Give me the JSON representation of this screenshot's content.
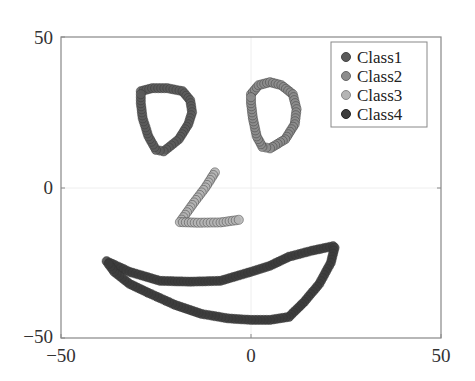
{
  "chart_data": {
    "type": "scatter",
    "title": "",
    "xlabel": "",
    "ylabel": "",
    "xlim": [
      -50,
      50
    ],
    "ylim": [
      -50,
      50
    ],
    "xticks": [
      -50,
      0,
      50
    ],
    "yticks": [
      -50,
      0,
      50
    ],
    "x_tick_labels": [
      "−50",
      "0",
      "50"
    ],
    "y_tick_labels": [
      "−50",
      "0",
      "50"
    ],
    "grid": true,
    "legend_position": "upper right",
    "series": [
      {
        "name": "Class1",
        "color": "#5a5a5a",
        "description": "left eye (closed loop)",
        "path": [
          [
            -29,
            32
          ],
          [
            -26,
            33
          ],
          [
            -22,
            33
          ],
          [
            -18,
            32
          ],
          [
            -16,
            29
          ],
          [
            -15.5,
            25
          ],
          [
            -16.5,
            21
          ],
          [
            -19,
            16
          ],
          [
            -23,
            12
          ],
          [
            -25,
            12.5
          ],
          [
            -27,
            17
          ],
          [
            -28.5,
            23
          ],
          [
            -29,
            28
          ],
          [
            -29,
            32
          ]
        ]
      },
      {
        "name": "Class2",
        "color": "#8c8c8c",
        "description": "right eye (closed loop)",
        "path": [
          [
            0,
            31
          ],
          [
            2,
            34
          ],
          [
            5,
            35
          ],
          [
            8,
            34
          ],
          [
            11,
            31
          ],
          [
            12,
            26
          ],
          [
            11.5,
            21
          ],
          [
            9,
            16
          ],
          [
            5,
            13
          ],
          [
            3,
            13.5
          ],
          [
            1.5,
            17
          ],
          [
            0.5,
            23
          ],
          [
            0,
            28
          ],
          [
            0,
            31
          ]
        ]
      },
      {
        "name": "Class3",
        "color": "#b4b4b4",
        "description": "nose (polyline)",
        "path": [
          [
            -9.5,
            5
          ],
          [
            -12,
            0
          ],
          [
            -15,
            -5
          ],
          [
            -18.7,
            -11.5
          ],
          [
            -14,
            -11.7
          ],
          [
            -8,
            -11.6
          ],
          [
            -2.4,
            -10.6
          ]
        ]
      },
      {
        "name": "Class4",
        "color": "#3c3c3c",
        "description": "mouth (closed loop)",
        "path": [
          [
            -38,
            -24.5
          ],
          [
            -32,
            -28
          ],
          [
            -24,
            -31
          ],
          [
            -16,
            -31.3
          ],
          [
            -8,
            -31
          ],
          [
            0,
            -28
          ],
          [
            5,
            -26
          ],
          [
            10,
            -23
          ],
          [
            16,
            -21
          ],
          [
            21.6,
            -19.5
          ],
          [
            22,
            -20
          ],
          [
            21,
            -25
          ],
          [
            18,
            -32
          ],
          [
            14,
            -38
          ],
          [
            10,
            -43
          ],
          [
            5,
            -44
          ],
          [
            0,
            -44
          ],
          [
            -6,
            -43.5
          ],
          [
            -13,
            -42
          ],
          [
            -20,
            -39
          ],
          [
            -27,
            -35
          ],
          [
            -32,
            -32
          ],
          [
            -36,
            -28
          ],
          [
            -38,
            -24.5
          ]
        ]
      }
    ]
  }
}
